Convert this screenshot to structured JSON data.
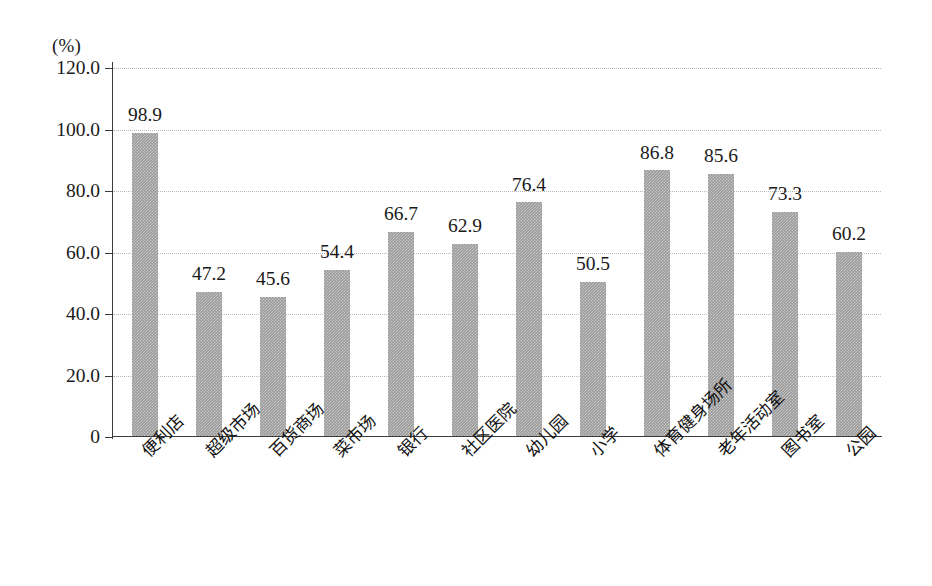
{
  "chart_data": {
    "type": "bar",
    "title": "",
    "subtitle": "",
    "unit_label": "(%)",
    "xlabel": "",
    "ylabel": "",
    "ylim": [
      0,
      120
    ],
    "y_ticks": [
      "0",
      "20.0",
      "40.0",
      "60.0",
      "80.0",
      "100.0",
      "120.0"
    ],
    "y_tick_values": [
      0,
      20,
      40,
      60,
      80,
      100,
      120
    ],
    "grid": true,
    "grid_axis": "y",
    "legend": false,
    "legend_position": "none",
    "bar_color": "#9a9a9a",
    "axis_color": "#3a3a3a",
    "gridline_color": "#b9b9b9",
    "categories": [
      "便利店",
      "超级市场",
      "百货商场",
      "菜市场",
      "银行",
      "社区医院",
      "幼儿园",
      "小学",
      "体育健身场所",
      "老年活动室",
      "图书室",
      "公园"
    ],
    "values": [
      98.9,
      47.2,
      45.6,
      54.4,
      66.7,
      62.9,
      76.4,
      50.5,
      86.8,
      85.6,
      73.3,
      60.2
    ],
    "value_labels": [
      "98.9",
      "47.2",
      "45.6",
      "54.4",
      "66.7",
      "62.9",
      "76.4",
      "50.5",
      "86.8",
      "85.6",
      "73.3",
      "60.2"
    ]
  }
}
